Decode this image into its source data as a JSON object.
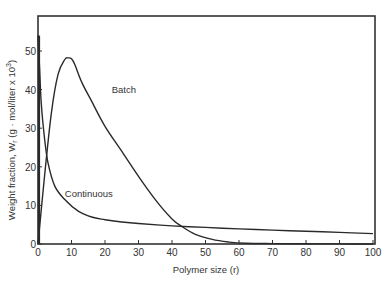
{
  "chart_data": {
    "type": "line",
    "title": "",
    "xlabel": "Polymer size (r)",
    "ylabel": "Weight fraction, W_r (g · mol/liter x 10³)",
    "xlim": [
      0,
      100
    ],
    "ylim": [
      0,
      57
    ],
    "xticks": [
      0,
      10,
      20,
      30,
      40,
      50,
      60,
      70,
      80,
      90,
      100
    ],
    "yticks": [
      0,
      10,
      20,
      30,
      40,
      50
    ],
    "grid": false,
    "legend": "inline labels",
    "series": [
      {
        "name": "Batch",
        "x": [
          0,
          2,
          4,
          6,
          8,
          9,
          10,
          11,
          13,
          16,
          20,
          25,
          30,
          35,
          40,
          43,
          47,
          52,
          57,
          62,
          70,
          80,
          90,
          100
        ],
        "y": [
          0,
          18,
          34,
          44,
          47.8,
          48.2,
          48,
          46.5,
          42,
          37,
          30.5,
          24,
          17.5,
          11.5,
          6.5,
          4.5,
          2.5,
          1.2,
          0.5,
          0.2,
          0.1,
          0.05,
          0.02,
          0
        ]
      },
      {
        "name": "Continuous",
        "x": [
          0,
          0.5,
          1,
          2,
          3,
          5,
          8,
          12,
          16,
          20,
          25,
          30,
          40,
          50,
          60,
          70,
          80,
          90,
          100
        ],
        "y": [
          54,
          45,
          36,
          27,
          21,
          15,
          11.5,
          8.5,
          7,
          6.3,
          5.7,
          5.3,
          4.7,
          4.3,
          3.9,
          3.6,
          3.3,
          3.0,
          2.7
        ]
      }
    ],
    "annotations": [
      {
        "text": "Batch",
        "x": 22,
        "y": 40
      },
      {
        "text": "Continuous",
        "x": 8,
        "y": 13
      }
    ]
  },
  "labels": {
    "xlabel": "Polymer size (r)",
    "ylabel": "Weight fraction, W",
    "ylabel_sub": "r",
    "ylabel_rest": " (g · mol/liter x 10",
    "ylabel_sup": "3",
    "ylabel_end": ")",
    "batch": "Batch",
    "continuous": "Continuous"
  }
}
